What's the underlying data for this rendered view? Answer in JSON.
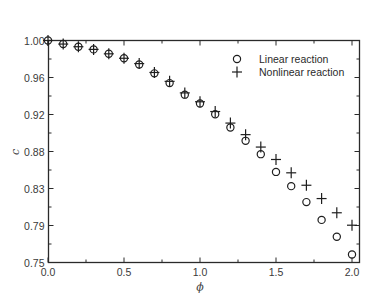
{
  "chart_data": {
    "type": "scatter",
    "title": "",
    "xlabel": "ϕ",
    "ylabel": "c",
    "xlim": [
      0.0,
      2.05
    ],
    "ylim": [
      0.75,
      1.0
    ],
    "grid": false,
    "legend_position": "upper right",
    "x_ticks": [
      "0.0",
      "0.5",
      "1.0",
      "1.5",
      "2.0"
    ],
    "y_ticks": [
      "1.00",
      "0.96",
      "0.92",
      "0.88",
      "0.83",
      "0.79",
      "0.75"
    ],
    "x": [
      0.0,
      0.1,
      0.2,
      0.3,
      0.4,
      0.5,
      0.6,
      0.7,
      0.8,
      0.9,
      1.0,
      1.1,
      1.2,
      1.3,
      1.4,
      1.5,
      1.6,
      1.7,
      1.8,
      1.9,
      2.0
    ],
    "series": [
      {
        "name": "Linear reaction",
        "marker": "circle",
        "values": [
          1.0,
          0.996,
          0.993,
          0.99,
          0.985,
          0.98,
          0.973,
          0.963,
          0.952,
          0.939,
          0.929,
          0.917,
          0.902,
          0.887,
          0.872,
          0.852,
          0.836,
          0.818,
          0.798,
          0.779,
          0.759
        ]
      },
      {
        "name": "Nonlinear reaction",
        "marker": "plus",
        "values": [
          1.0,
          0.996,
          0.993,
          0.99,
          0.985,
          0.98,
          0.974,
          0.964,
          0.954,
          0.941,
          0.931,
          0.92,
          0.907,
          0.894,
          0.88,
          0.866,
          0.851,
          0.837,
          0.822,
          0.806,
          0.792
        ]
      }
    ]
  },
  "colors": {
    "axis": "#2a2a2a",
    "marker": "#1e1e1e",
    "background": "#ffffff"
  }
}
